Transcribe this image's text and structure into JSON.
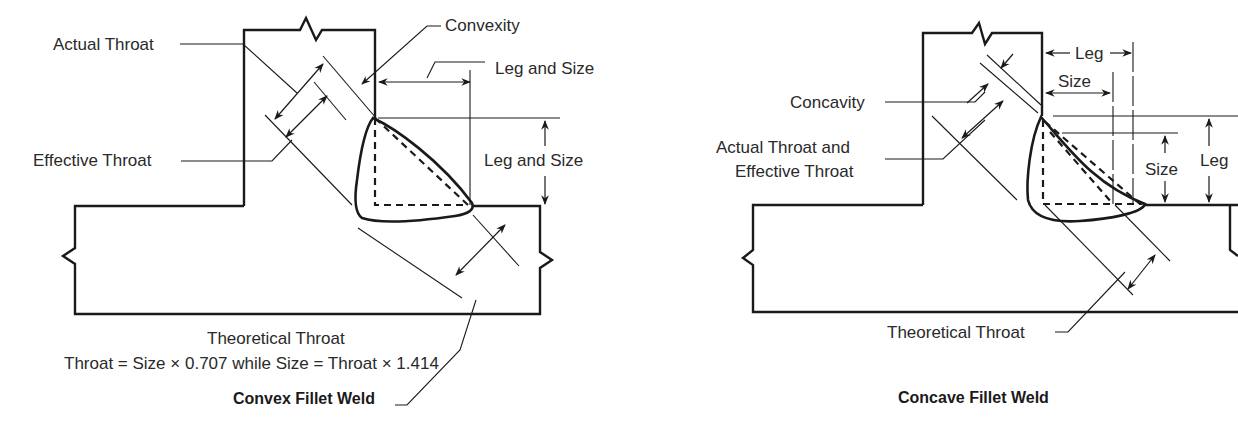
{
  "convex": {
    "title": "Convex Fillet Weld",
    "labels": {
      "actual_throat": "Actual Throat",
      "convexity": "Convexity",
      "leg_and_size_horizontal": "Leg and Size",
      "effective_throat": "Effective Throat",
      "leg_and_size_vertical": "Leg and Size",
      "theoretical_throat": "Theoretical Throat"
    },
    "formula": "Throat = Size × 0.707  while  Size = Throat × 1.414"
  },
  "concave": {
    "title": "Concave Fillet Weld",
    "labels": {
      "leg_horizontal": "Leg",
      "size_horizontal": "Size",
      "concavity": "Concavity",
      "actual_and_effective_line1": "Actual Throat and",
      "actual_and_effective_line2": "Effective Throat",
      "size_vertical": "Size",
      "leg_vertical": "Leg",
      "theoretical_throat": "Theoretical Throat"
    }
  }
}
